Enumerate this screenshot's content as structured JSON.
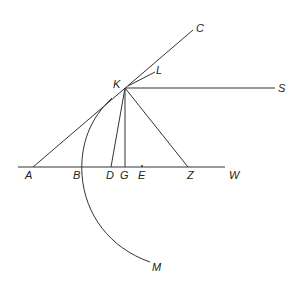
{
  "diagram": {
    "stroke_color": "#333333",
    "points": {
      "A": {
        "label": "A",
        "x": 33,
        "y": 167
      },
      "B": {
        "label": "B",
        "x": 82,
        "y": 167
      },
      "C": {
        "label": "C",
        "x": 193,
        "y": 30
      },
      "D": {
        "label": "D",
        "x": 111,
        "y": 167
      },
      "E": {
        "label": "E",
        "x": 142,
        "y": 167
      },
      "G": {
        "label": "G",
        "x": 125,
        "y": 167
      },
      "K": {
        "label": "K",
        "x": 125,
        "y": 88
      },
      "L": {
        "label": "L",
        "x": 155,
        "y": 72
      },
      "M": {
        "label": "M",
        "x": 150,
        "y": 262
      },
      "S": {
        "label": "S",
        "x": 275,
        "y": 88
      },
      "W": {
        "label": "W",
        "x": 225,
        "y": 167
      },
      "Z": {
        "label": "Z",
        "x": 188,
        "y": 167
      }
    },
    "segments": [
      [
        "A",
        "C"
      ],
      [
        "K",
        "S"
      ],
      [
        "K",
        "L"
      ],
      [
        "K",
        "D"
      ],
      [
        "K",
        "G"
      ],
      [
        "K",
        "Z"
      ],
      [
        "baseline_start",
        "W"
      ]
    ],
    "arc": {
      "from": "K",
      "through": "B",
      "to": "M"
    }
  }
}
